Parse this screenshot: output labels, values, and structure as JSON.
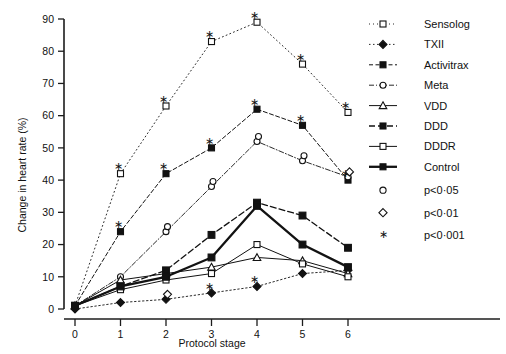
{
  "figure": {
    "title": "",
    "background": "#ffffff",
    "ink": "#121212"
  },
  "axes": {
    "y_title": "Change in heart rate (%)",
    "x_title": "Protocol stage",
    "y_ticks": [
      "0",
      "10",
      "20",
      "30",
      "40",
      "50",
      "60",
      "70",
      "80",
      "90"
    ],
    "x_ticks": [
      "0",
      "1",
      "2",
      "3",
      "4",
      "5",
      "6"
    ]
  },
  "legend": {
    "entries": [
      {
        "label": "Sensolog",
        "marker": "open-square",
        "dash": "1,3",
        "width": 0.9,
        "filled": false
      },
      {
        "label": "TXII",
        "marker": "filled-diamond",
        "dash": "1.5,2.5",
        "width": 0.9,
        "filled": true
      },
      {
        "label": "Activitrax",
        "marker": "filled-square",
        "dash": "4,2.5",
        "width": 1.0,
        "filled": true
      },
      {
        "label": "Meta",
        "marker": "open-circle",
        "dash": "5,2,1,2",
        "width": 0.9,
        "filled": false
      },
      {
        "label": "VDD",
        "marker": "open-triangle",
        "dash": "none",
        "width": 1.0,
        "filled": false
      },
      {
        "label": "DDD",
        "marker": "filled-square",
        "dash": "6,3",
        "width": 1.3,
        "filled": true
      },
      {
        "label": "DDDR",
        "marker": "open-square",
        "dash": "none",
        "width": 1.0,
        "filled": false
      },
      {
        "label": "Control",
        "marker": "filled-square",
        "dash": "none",
        "width": 2.3,
        "filled": true
      }
    ],
    "significance": [
      {
        "label": "p<0·05",
        "marker": "open-circle"
      },
      {
        "label": "p<0·01",
        "marker": "open-diamond"
      },
      {
        "label": "p<0·001",
        "marker": "star"
      }
    ]
  },
  "chart_data": {
    "type": "line",
    "title": "",
    "xlabel": "Protocol stage",
    "ylabel": "Change in heart rate (%)",
    "x": [
      0,
      1,
      2,
      3,
      4,
      5,
      6
    ],
    "xlim": [
      0,
      6
    ],
    "ylim": [
      0,
      90
    ],
    "grid": false,
    "legend_position": "right",
    "series": [
      {
        "name": "Sensolog",
        "marker": "open-square",
        "dash": "1,3",
        "width": 0.9,
        "values": [
          1,
          42,
          63,
          83,
          89,
          76,
          61
        ],
        "significance": [
          null,
          "star",
          "star",
          "star",
          "star",
          "star",
          "star"
        ]
      },
      {
        "name": "TXII",
        "marker": "filled-diamond",
        "dash": "1.5,2.5",
        "width": 0.9,
        "values": [
          0,
          2,
          3,
          5,
          7,
          11,
          12
        ],
        "significance": [
          null,
          null,
          "open-diamond",
          "star",
          "star",
          null,
          null
        ]
      },
      {
        "name": "Activitrax",
        "marker": "filled-square",
        "dash": "4,2.5",
        "width": 1.0,
        "values": [
          1,
          24,
          42,
          50,
          62,
          57,
          40
        ],
        "significance": [
          null,
          "star",
          "star",
          "star",
          "star",
          "star",
          "star"
        ]
      },
      {
        "name": "Meta",
        "marker": "open-circle",
        "dash": "5,2,1,2",
        "width": 0.9,
        "values": [
          1,
          10,
          24,
          38,
          52,
          46,
          41
        ],
        "significance": [
          null,
          null,
          "open-circle",
          "open-circle",
          "open-circle",
          "open-circle",
          "open-diamond"
        ]
      },
      {
        "name": "VDD",
        "marker": "open-triangle",
        "dash": "none",
        "width": 1.0,
        "values": [
          1,
          9,
          11,
          13,
          16,
          15,
          11
        ]
      },
      {
        "name": "DDD",
        "marker": "filled-square",
        "dash": "6,3",
        "width": 1.3,
        "values": [
          1,
          7,
          12,
          23,
          33,
          29,
          19
        ]
      },
      {
        "name": "DDDR",
        "marker": "open-square",
        "dash": "none",
        "width": 1.0,
        "values": [
          1,
          6,
          9,
          11,
          20,
          14,
          10
        ]
      },
      {
        "name": "Control",
        "marker": "filled-square",
        "dash": "none",
        "width": 2.3,
        "values": [
          1,
          7,
          10,
          16,
          32,
          20,
          13
        ]
      }
    ]
  }
}
